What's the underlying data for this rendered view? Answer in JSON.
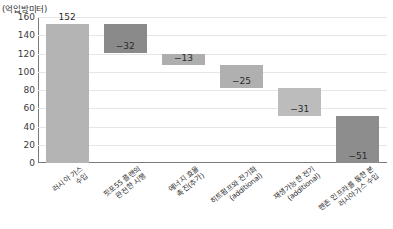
{
  "chart_data": {
    "type": "bar",
    "subtype": "waterfall",
    "title": "",
    "xlabel": "",
    "ylabel": "",
    "unit_label": "(억입방미터)",
    "ylim": [
      0,
      160
    ],
    "yticks": [
      0,
      20,
      40,
      60,
      80,
      100,
      120,
      140,
      160
    ],
    "ytick_labels": [
      "0",
      "20",
      "40",
      "60",
      "80",
      "100",
      "120",
      "140",
      "160"
    ],
    "grid": true,
    "legend": "none",
    "categories": [
      "러시아 가스\n수입",
      "핏포55 플랜의\n완전한 시행",
      "에너지 효율\n촉진(추가)",
      "히트펌프와 전기화\n(additional)",
      "재생가능한 전기\n(additional)",
      "펜존 인프라를 통한 본\n러시아가스 수입"
    ],
    "values": [
      152,
      -32,
      -13,
      -25,
      -31,
      -51
    ],
    "value_labels": [
      "152",
      "−32",
      "−13",
      "−25",
      "−31",
      "−51"
    ],
    "cumulative_start": [
      0,
      120,
      107,
      82,
      51,
      0
    ],
    "cumulative_end": [
      152,
      152,
      120,
      107,
      82,
      51
    ],
    "bar_colors": [
      "#b4b4b4",
      "#8a8a8a",
      "#aeaeae",
      "#b0b0b0",
      "#bcbcbc",
      "#8d8d8d"
    ],
    "label_positions": [
      "above",
      "inside",
      "inside",
      "inside",
      "inside",
      "inside"
    ],
    "colors": {
      "grid": "#e6e6e6",
      "axis": "#7a7a7a",
      "text": "#2b2b2b",
      "background": "#ffffff"
    }
  }
}
